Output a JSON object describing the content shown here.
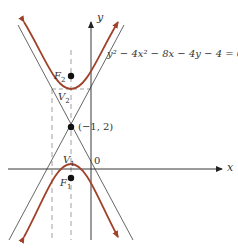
{
  "diagram": {
    "type": "hyperbola-graph",
    "equation": "y² − 4x² − 8x − 4y − 4 = 0",
    "axes": {
      "x_label": "x",
      "y_label": "y",
      "origin_label": "0"
    },
    "points": {
      "center": {
        "label": "(−1, 2)"
      },
      "F2": {
        "label_main": "F",
        "label_sub": "2"
      },
      "V2": {
        "label_main": "V",
        "label_sub": "2"
      },
      "V1": {
        "label_main": "V",
        "label_sub": "1"
      },
      "F1": {
        "label_main": "F",
        "label_sub": "1"
      }
    },
    "colors": {
      "curve": "#a0412a",
      "asymptote": "#555555",
      "axis": "#222222",
      "dashed": "#888888"
    }
  }
}
